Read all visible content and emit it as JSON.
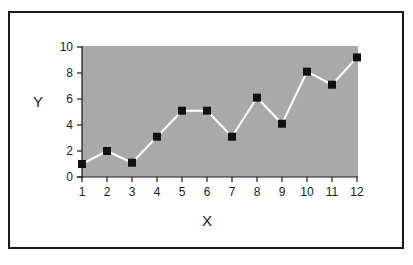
{
  "chart_data": {
    "type": "line",
    "title": "",
    "xlabel": "X",
    "ylabel": "Y",
    "x": [
      1,
      2,
      3,
      4,
      5,
      6,
      7,
      8,
      9,
      10,
      11,
      12
    ],
    "series": [
      {
        "name": "Y",
        "values": [
          1.0,
          2.0,
          1.1,
          3.1,
          5.1,
          5.1,
          3.1,
          6.1,
          4.1,
          8.1,
          7.1,
          9.2
        ],
        "line_color": "#ffffff",
        "marker": "square",
        "marker_color": "#111111"
      }
    ],
    "xlim": [
      1,
      12
    ],
    "ylim": [
      0,
      10
    ],
    "x_ticks": [
      "1",
      "2",
      "3",
      "4",
      "5",
      "6",
      "7",
      "8",
      "9",
      "10",
      "11",
      "12"
    ],
    "y_ticks": [
      "0",
      "2",
      "4",
      "6",
      "8",
      "10"
    ],
    "grid": false,
    "legend": "none",
    "plot_background": "#a9a9a9"
  },
  "axes": {
    "x_title": "X",
    "y_title": "Y"
  }
}
